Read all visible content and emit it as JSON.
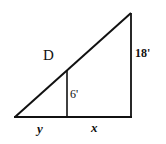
{
  "diagram": {
    "type": "similar-triangles",
    "labels": {
      "point": "D",
      "small_height": "6'",
      "large_height": "18'",
      "base_left": "y",
      "base_right": "x"
    },
    "stroke_color": "#111111",
    "background": "#ffffff"
  }
}
